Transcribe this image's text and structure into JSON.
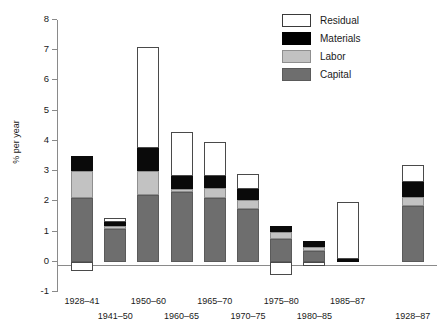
{
  "chart_data": {
    "type": "bar",
    "subtype": "stacked-bar-with-negatives",
    "title": "",
    "xlabel": "",
    "ylabel": "% per year",
    "ylim": [
      -1,
      8
    ],
    "yticks": [
      -1,
      0,
      1,
      2,
      3,
      4,
      5,
      6,
      7,
      8
    ],
    "ytick_labels": [
      "-1",
      "0",
      "1",
      "2",
      "3",
      "4",
      "5",
      "6",
      "7",
      "8"
    ],
    "grid": false,
    "legend_position": "top-right",
    "categories": [
      "1928–41",
      "1941–50",
      "1950–60",
      "1960–65",
      "1965–70",
      "1970–75",
      "1975–80",
      "1980–85",
      "1985–87",
      "1928–87"
    ],
    "series": [
      {
        "name": "Capital",
        "color": "#6e6e6e",
        "values": [
          2.1,
          1.1,
          2.2,
          2.3,
          2.1,
          1.75,
          0.75,
          0.35,
          0.0,
          1.85
        ]
      },
      {
        "name": "Labor",
        "color": "#c2c2c2",
        "values": [
          0.9,
          0.08,
          0.8,
          0.1,
          0.35,
          0.3,
          0.25,
          0.15,
          0.0,
          0.3
        ]
      },
      {
        "name": "Materials",
        "color": "#000000",
        "values": [
          0.5,
          0.15,
          0.75,
          0.45,
          0.4,
          0.35,
          0.2,
          0.2,
          0.08,
          0.5
        ]
      },
      {
        "name": "Residual",
        "color": "#ffffff",
        "values": [
          -0.3,
          0.12,
          3.35,
          1.45,
          1.1,
          0.5,
          -0.45,
          -0.15,
          1.89,
          0.55
        ]
      }
    ],
    "totals": [
      3.5,
      1.45,
      7.1,
      4.3,
      3.95,
      2.9,
      1.2,
      0.7,
      1.97,
      3.2
    ]
  },
  "legend": {
    "items": [
      {
        "label": "Residual",
        "key": "residual"
      },
      {
        "label": "Materials",
        "key": "materials"
      },
      {
        "label": "Labor",
        "key": "labor"
      },
      {
        "label": "Capital",
        "key": "capital"
      }
    ]
  }
}
